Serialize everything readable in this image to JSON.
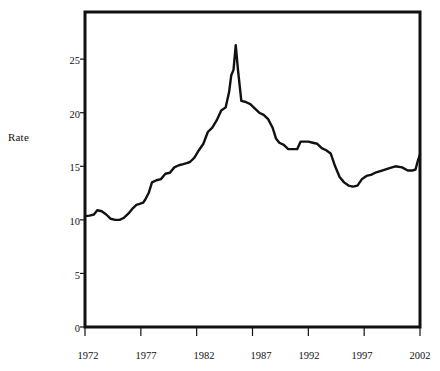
{
  "chart_data": {
    "type": "line",
    "title": "",
    "xlabel": "",
    "ylabel": "Rate",
    "xlim": [
      1972,
      2002
    ],
    "ylim": [
      0,
      29.4
    ],
    "grid": false,
    "legend": null,
    "yticks": [
      0,
      5,
      10,
      15,
      20,
      25
    ],
    "ytick_labels": [
      "0",
      "5",
      "10",
      "15",
      "20",
      "25"
    ],
    "xticks": [
      1972,
      1977,
      1982,
      1987,
      1992,
      1997,
      2002
    ],
    "xtick_labels": [
      "1972",
      "1977",
      "1982",
      "1987",
      "1992",
      "1997",
      "2002"
    ],
    "series": [
      {
        "name": "Rate",
        "color": "#111111",
        "x": [
          1972.0,
          1972.4,
          1972.8,
          1973.1,
          1973.5,
          1973.9,
          1974.3,
          1974.7,
          1975.1,
          1975.5,
          1975.9,
          1976.3,
          1976.6,
          1976.9,
          1977.2,
          1977.4,
          1977.7,
          1978.0,
          1978.4,
          1978.8,
          1979.2,
          1979.6,
          1980.0,
          1980.4,
          1980.8,
          1981.1,
          1981.4,
          1981.8,
          1982.2,
          1982.6,
          1983.0,
          1983.4,
          1983.8,
          1984.2,
          1984.6,
          1984.9,
          1985.1,
          1985.3,
          1985.5,
          1985.7,
          1986.0,
          1986.4,
          1986.8,
          1987.2,
          1987.6,
          1988.0,
          1988.4,
          1988.8,
          1989.1,
          1989.4,
          1989.8,
          1990.2,
          1990.6,
          1991.0,
          1991.3,
          1991.6,
          1992.0,
          1992.4,
          1992.8,
          1993.2,
          1993.6,
          1994.0,
          1994.4,
          1994.8,
          1995.2,
          1995.6,
          1996.0,
          1996.4,
          1996.8,
          1997.2,
          1997.6,
          1998.0,
          1998.6,
          1999.2,
          1999.8,
          2000.4,
          2000.9,
          2001.3,
          2001.6,
          2001.8,
          2002.0
        ],
        "y": [
          10.35,
          10.4,
          10.5,
          10.9,
          10.8,
          10.5,
          10.1,
          10.0,
          10.0,
          10.2,
          10.6,
          11.1,
          11.4,
          11.5,
          11.6,
          11.9,
          12.5,
          13.5,
          13.7,
          13.8,
          14.3,
          14.4,
          14.9,
          15.1,
          15.2,
          15.3,
          15.4,
          15.8,
          16.5,
          17.1,
          18.2,
          18.6,
          19.3,
          20.2,
          20.5,
          21.9,
          23.5,
          24.0,
          26.3,
          24.0,
          21.1,
          21.0,
          20.8,
          20.4,
          20.0,
          19.8,
          19.4,
          18.6,
          17.6,
          17.2,
          17.0,
          16.6,
          16.6,
          16.6,
          17.3,
          17.3,
          17.3,
          17.2,
          17.1,
          16.7,
          16.5,
          16.2,
          15.0,
          14.0,
          13.5,
          13.2,
          13.1,
          13.2,
          13.8,
          14.1,
          14.2,
          14.4,
          14.6,
          14.8,
          15.0,
          14.9,
          14.6,
          14.6,
          14.7,
          15.5,
          16.1
        ]
      }
    ]
  },
  "figure": {
    "plot_area": {
      "left": 85,
      "top": 12,
      "right": 420,
      "bottom": 327
    },
    "axis_color": "#111111",
    "background": "#ffffff",
    "line_color": "#111111",
    "line_width": 2.4
  }
}
